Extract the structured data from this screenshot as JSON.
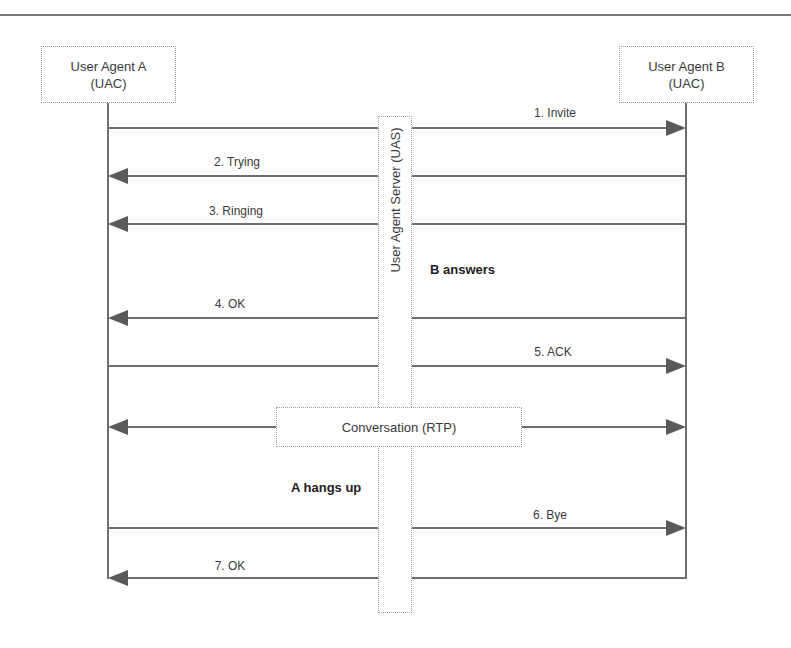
{
  "diagram": {
    "type": "sequence",
    "actors": [
      {
        "id": "A",
        "line1": "User Agent A",
        "line2": "(UAC)"
      },
      {
        "id": "B",
        "line1": "User Agent B",
        "line2": "(UAC)"
      }
    ],
    "server": {
      "label": "User Agent Server (UAS)"
    },
    "messages": [
      {
        "label": "1. Invite",
        "direction": "A->B"
      },
      {
        "label": "2. Trying",
        "direction": "B->A"
      },
      {
        "label": "3. Ringing",
        "direction": "B->A"
      },
      {
        "label": "4. OK",
        "direction": "B->A"
      },
      {
        "label": "5. ACK",
        "direction": "A->B"
      },
      {
        "label": "Conversation (RTP)",
        "direction": "A<->B"
      },
      {
        "label": "6. Bye",
        "direction": "A->B"
      },
      {
        "label": "7. OK",
        "direction": "B->A"
      }
    ],
    "notes": {
      "b_answers": "B answers",
      "a_hangs_up": "A hangs up"
    },
    "colors": {
      "line": "#6e6e6e",
      "arrowhead": "#5a5a5a",
      "box_border": "#a0a0a0",
      "text": "#3a3a3a"
    }
  }
}
